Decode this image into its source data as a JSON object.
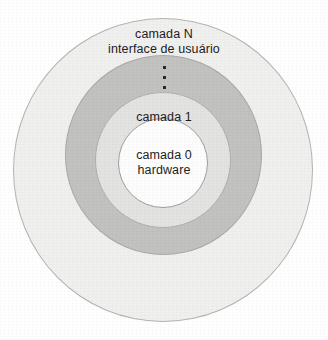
{
  "diagram": {
    "type": "concentric-layers",
    "background_color": "#ffffff",
    "layers": [
      {
        "id": "outer",
        "name": "camada-n",
        "label_line1": "camada N",
        "label_line2": "interface de usuário",
        "fill_color": "#f0f0ef",
        "stroke_color": "#b4b4b2"
      },
      {
        "id": "middle",
        "name": "camadas-intermediarias",
        "label_line1": "",
        "label_line2": "",
        "fill_color": "#c2c2c0",
        "stroke_color": "#a8a8a6"
      },
      {
        "id": "layer1",
        "name": "camada-1",
        "label_line1": "camada 1",
        "label_line2": "",
        "fill_color": "#e3e3e1",
        "stroke_color": "#b0b0ae"
      },
      {
        "id": "core",
        "name": "camada-0",
        "label_line1": "camada 0",
        "label_line2": "hardware",
        "fill_color": "#fdfdfd",
        "stroke_color": "#9e9e9c"
      }
    ],
    "ellipsis": {
      "glyph": "vertical-ellipsis",
      "dot_count": 3,
      "meaning": "camadas intermediárias omitidas"
    },
    "text_color": "#1d1d1d"
  }
}
